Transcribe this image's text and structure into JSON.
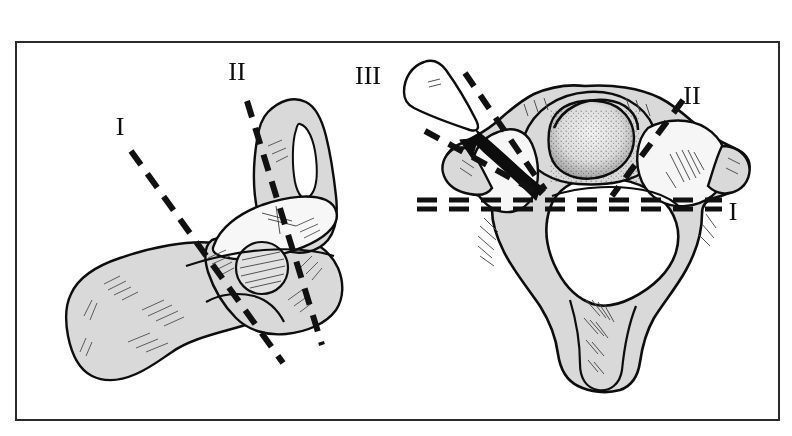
{
  "figure": {
    "border": {
      "present": true,
      "color": "#2b2b2b",
      "x": 16,
      "y": 42,
      "width": 763,
      "height": 378,
      "stroke_width": 2
    },
    "background_color": "#ffffff",
    "bone_fill_color": "#d9d9d9",
    "bone_fill_light_color": "#f2f2f2",
    "outline_color": "#0d0d0d",
    "dash_color": "#111111"
  },
  "labels": [
    {
      "id": "label-one-left",
      "text": "I",
      "x": 120,
      "y": 135,
      "size": 26,
      "view": "lateral"
    },
    {
      "id": "label-two-left",
      "text": "II",
      "x": 237,
      "y": 80,
      "size": 26,
      "view": "lateral"
    },
    {
      "id": "label-three-right",
      "text": "III",
      "x": 368,
      "y": 84,
      "size": 26,
      "view": "superior"
    },
    {
      "id": "label-two-right",
      "text": "II",
      "x": 692,
      "y": 104,
      "size": 26,
      "view": "superior"
    },
    {
      "id": "label-one-right",
      "text": "I",
      "x": 733,
      "y": 220,
      "size": 26,
      "view": "superior"
    }
  ],
  "section_planes": {
    "lateral": [
      {
        "name": "plane-I-lateral",
        "roman": "I",
        "from": [
          131,
          151
        ],
        "to": [
          283,
          363
        ],
        "style": "dashed",
        "width": 6
      },
      {
        "name": "plane-II-lateral",
        "roman": "II",
        "from": [
          247,
          101
        ],
        "to": [
          322,
          345
        ],
        "style": "dashed",
        "width": 6
      }
    ],
    "superior": [
      {
        "name": "plane-I-superior-upper",
        "roman": "I",
        "from": [
          417,
          200
        ],
        "to": [
          722,
          200
        ],
        "style": "dashed",
        "width": 5
      },
      {
        "name": "plane-I-superior-lower",
        "roman": "I",
        "from": [
          417,
          209
        ],
        "to": [
          722,
          209
        ],
        "style": "dashed",
        "width": 5
      },
      {
        "name": "plane-II-superior",
        "roman": "II",
        "from": [
          683,
          100
        ],
        "to": [
          612,
          196
        ],
        "style": "dashed",
        "width": 6
      },
      {
        "name": "plane-III-superior-a",
        "roman": "III",
        "from": [
          465,
          73
        ],
        "to": [
          545,
          190
        ],
        "style": "dashed",
        "width": 6
      },
      {
        "name": "plane-III-superior-b",
        "roman": "III",
        "from": [
          425,
          131
        ],
        "to": [
          540,
          194
        ],
        "style": "dashed",
        "width": 6
      }
    ]
  },
  "annotations": {
    "fragment_wedge": {
      "name": "detached-bone-fragment",
      "roman": "III",
      "description": "wedge shaped avulsed bone fragment drawn outside the vertebral body"
    },
    "arrow": {
      "name": "displacement-arrow",
      "direction": "up-left",
      "description": "solid arrow indicating displacement of the wedge fragment"
    }
  },
  "views": [
    {
      "name": "lateral-view",
      "label": "lateral view of cervical vertebra",
      "center_x": 210,
      "center_y": 240
    },
    {
      "name": "superior-view",
      "label": "superior view of cervical vertebra",
      "center_x": 585,
      "center_y": 240
    }
  ]
}
